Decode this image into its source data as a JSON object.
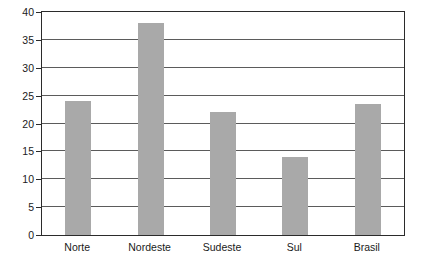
{
  "chart_data": {
    "type": "bar",
    "title": "",
    "subtitle": "",
    "xlabel": "",
    "ylabel": "",
    "categories": [
      "Norte",
      "Nordeste",
      "Sudeste",
      "Sul",
      "Brasil"
    ],
    "values": [
      24,
      38,
      22,
      14,
      23.5
    ],
    "ylim": [
      0,
      40
    ],
    "yticks": [
      0,
      5,
      10,
      15,
      20,
      25,
      30,
      35,
      40
    ],
    "ytick_labels": [
      "0",
      "5",
      "10",
      "15",
      "20",
      "25",
      "30",
      "35",
      "40"
    ],
    "grid": true,
    "grid_axis": "y",
    "legend": false,
    "legend_position": "none",
    "bar_color": "#a9a9a9",
    "frame_color": "#2b2b2b",
    "gridline_color": "#5b5b5b",
    "background_color": "#ffffff"
  }
}
